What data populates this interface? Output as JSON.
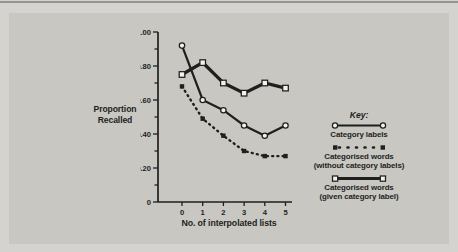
{
  "colors": {
    "ink": "#1f1f1d",
    "page": "#d4d3cf",
    "panel": "#c8c7c2",
    "marker_fill": "#f2f1ed"
  },
  "key": {
    "title": "Key:",
    "entries": [
      {
        "label": "Category labels",
        "label2": "",
        "marker": "open-circle",
        "line": "thin-solid"
      },
      {
        "label": "Categorised words",
        "label2": "(without category labels)",
        "marker": "filled-square",
        "line": "dotted"
      },
      {
        "label": "Categorised words",
        "label2": "(given category label)",
        "marker": "open-square",
        "line": "thick-solid"
      }
    ]
  },
  "chart_data": {
    "type": "line",
    "title": "",
    "xlabel": "No. of interpolated lists",
    "ylabel": "Proportion Recalled",
    "x": [
      0,
      1,
      2,
      3,
      4,
      5
    ],
    "ylim": [
      0,
      1.0
    ],
    "ytick_major": [
      0,
      0.2,
      0.4,
      0.6,
      0.8,
      1.0
    ],
    "ytick_labels": [
      "0",
      "0.20",
      "0.40",
      "0.60",
      "0.80",
      "1.00"
    ],
    "ytick_minor_step": 0.1,
    "grid": false,
    "legend_position": "right",
    "series": [
      {
        "name": "Category labels",
        "style": "thin-solid",
        "marker": "open-circle",
        "values": [
          0.92,
          0.6,
          0.54,
          0.45,
          0.39,
          0.45
        ]
      },
      {
        "name": "Categorised words (without category labels)",
        "style": "dotted",
        "marker": "filled-square",
        "values": [
          0.68,
          0.49,
          0.39,
          0.3,
          0.27,
          0.27
        ]
      },
      {
        "name": "Categorised words (given category label)",
        "style": "thick-solid",
        "marker": "open-square",
        "values": [
          0.75,
          0.82,
          0.7,
          0.64,
          0.7,
          0.67
        ]
      }
    ]
  }
}
